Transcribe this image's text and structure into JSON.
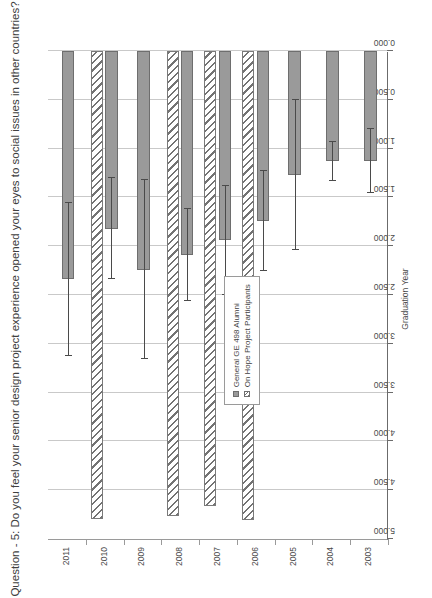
{
  "chart_data": {
    "type": "bar",
    "orientation": "horizontal",
    "title": "Question - 5: Do you feel your senior design project experience opened your eyes to social issues in other countries?",
    "xlabel": "Graduation Year",
    "ylabel": "Average Alumni Response",
    "categories": [
      "2003",
      "2004",
      "2005",
      "2006",
      "2007",
      "2008",
      "2009",
      "2010",
      "2011"
    ],
    "value_axis_ticks": [
      "0.000",
      "0.500",
      "1.000",
      "1.500",
      "2.000",
      "2.500",
      "3.000",
      "3.500",
      "4.000",
      "4.500",
      "5.000"
    ],
    "value_axis_min": 0.0,
    "value_axis_max": 5.0,
    "value_axis_reversed": true,
    "grid": true,
    "legend_position": "inside-left-lower",
    "series": [
      {
        "name": "General GE 498 Alumni",
        "style": "solid-gray",
        "color": "#9a9a9a",
        "values": [
          1.13,
          1.13,
          1.27,
          1.74,
          1.94,
          2.09,
          2.24,
          1.82,
          2.34
        ],
        "error_low": [
          0.8,
          0.93,
          0.5,
          1.23,
          1.38,
          1.62,
          1.32,
          1.3,
          1.56
        ],
        "error_high": [
          1.46,
          1.33,
          2.04,
          2.25,
          2.5,
          2.56,
          3.16,
          2.34,
          3.12
        ]
      },
      {
        "name": "On Hope Project Participants",
        "style": "diagonal-hatch",
        "color": "#737373",
        "values": [
          null,
          null,
          null,
          4.81,
          4.66,
          4.76,
          null,
          4.8,
          null
        ]
      }
    ]
  },
  "legend": {
    "items": [
      {
        "label": "General GE 498 Alumni"
      },
      {
        "label": "On Hope Project Participants"
      }
    ]
  }
}
